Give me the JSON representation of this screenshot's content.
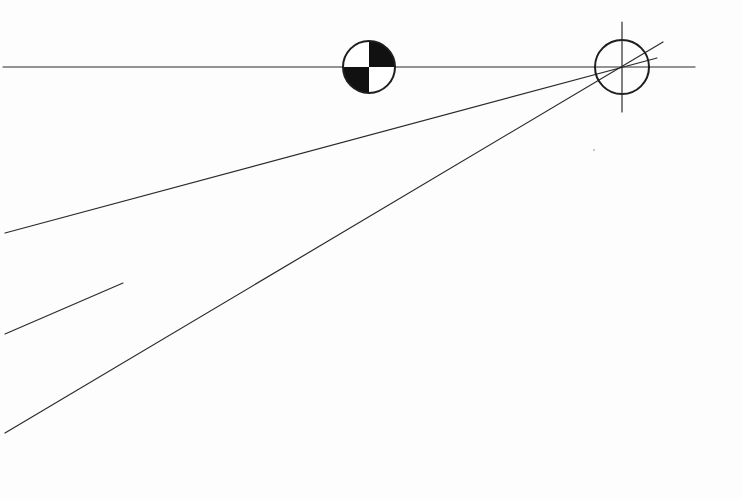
{
  "diagram": {
    "type": "perspective-construction",
    "background": "#fdfdfd",
    "stroke_color": "#2a2a2a",
    "horizon_line": {
      "x1": 3,
      "y1": 67,
      "x2": 695,
      "y2": 67
    },
    "center_of_mass_marker": {
      "cx": 369,
      "cy": 67,
      "r": 26,
      "fill_color": "#111111",
      "filled_quadrants": [
        "top-right",
        "bottom-left"
      ]
    },
    "vanishing_point_target": {
      "cx": 622,
      "cy": 67,
      "r": 27,
      "vertical_tick": {
        "x": 622,
        "y1": 22,
        "y2": 112
      }
    },
    "converging_lines": [
      {
        "name": "upper-ray",
        "x1": 5,
        "y1": 233,
        "x2": 657,
        "y2": 58
      },
      {
        "name": "lower-ray",
        "x1": 5,
        "y1": 433,
        "x2": 663,
        "y2": 42
      }
    ],
    "partial_line": {
      "x1": 5,
      "y1": 334,
      "x2": 123,
      "y2": 283
    },
    "stray_mark": {
      "cx": 594,
      "cy": 150,
      "r": 0.8
    }
  }
}
